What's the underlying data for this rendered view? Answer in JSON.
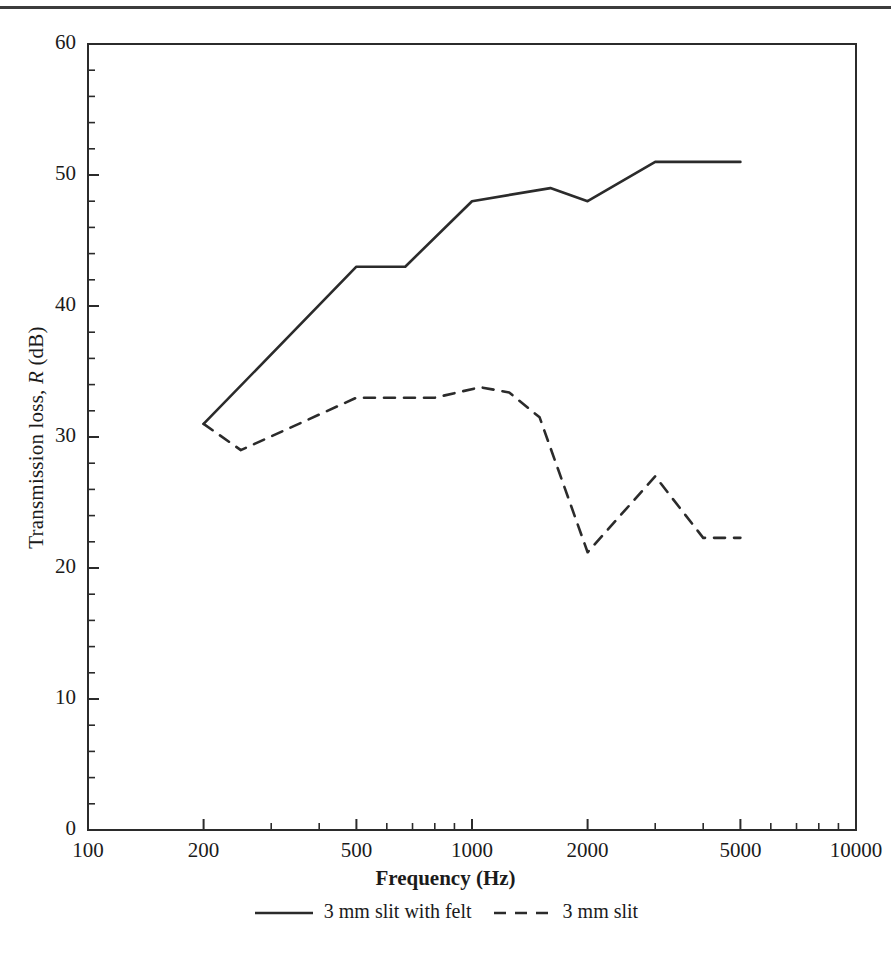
{
  "figure": {
    "background": "#ffffff",
    "ink": "#2b2b2b",
    "top_rule": true
  },
  "chart_data": {
    "type": "line",
    "title": "",
    "xlabel": "Frequency (Hz)",
    "ylabel": "Transmission loss, R (dB)",
    "ylabel_parts": {
      "pre": "Transmission loss, ",
      "italic": "R",
      "post": " (dB)"
    },
    "xscale": "log",
    "yscale": "linear",
    "xlim": [
      100,
      10000
    ],
    "ylim": [
      0,
      60
    ],
    "grid": false,
    "legend_position": "below-axes",
    "x_ticks": [
      100,
      200,
      500,
      1000,
      2000,
      5000,
      10000
    ],
    "x_tick_labels": [
      "100",
      "200",
      "500",
      "1000",
      "2000",
      "5000",
      "10000"
    ],
    "y_ticks": [
      0,
      10,
      20,
      30,
      40,
      50,
      60
    ],
    "y_tick_labels": [
      "0",
      "10",
      "20",
      "30",
      "40",
      "50",
      "60"
    ],
    "y_minor_step": 2,
    "series": [
      {
        "name": "3 mm slit with felt",
        "style": "solid",
        "color": "#2b2b2b",
        "x": [
          200,
          500,
          670,
          1000,
          1600,
          2000,
          3000,
          5000
        ],
        "y": [
          31,
          43,
          43,
          48,
          49,
          48,
          51,
          51
        ]
      },
      {
        "name": "3 mm slit",
        "style": "dashed",
        "color": "#2b2b2b",
        "x": [
          200,
          250,
          500,
          800,
          1050,
          1250,
          1500,
          2000,
          3000,
          4000,
          5000
        ],
        "y": [
          31,
          29,
          33,
          33,
          33.8,
          33.4,
          31.5,
          21.2,
          27,
          22.3,
          22.3
        ]
      }
    ]
  },
  "legend": {
    "entries": [
      {
        "label": "3 mm slit with felt",
        "style": "solid"
      },
      {
        "label": "3 mm slit",
        "style": "dashed"
      }
    ]
  }
}
